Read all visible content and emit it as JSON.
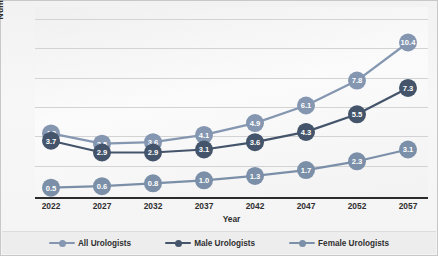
{
  "chart_data": {
    "type": "line",
    "title": "",
    "xlabel": "Year",
    "ylabel": "Number Per 100,000",
    "categories": [
      "2022",
      "2027",
      "2032",
      "2037",
      "2042",
      "2047",
      "2052",
      "2057"
    ],
    "x": [
      2022,
      2027,
      2032,
      2037,
      2042,
      2047,
      2052,
      2057
    ],
    "ylim": [
      0,
      12
    ],
    "xlim": [
      2022,
      2057
    ],
    "grid": "horizontal",
    "legend_position": "bottom",
    "y_tick_labels": [],
    "series": [
      {
        "name": "All Urologists",
        "color": "#8496b0",
        "values": [
          4.2,
          3.5,
          3.6,
          4.1,
          4.9,
          6.1,
          7.8,
          10.4
        ],
        "labels": [
          "4.2",
          "3.5",
          "3.6",
          "4.1",
          "4.9",
          "6.1",
          "7.8",
          "10.4"
        ]
      },
      {
        "name": "Male Urologists",
        "color": "#44546a",
        "values": [
          3.7,
          2.9,
          2.9,
          3.1,
          3.6,
          4.3,
          5.5,
          7.3
        ],
        "labels": [
          "3.7",
          "2.9",
          "2.9",
          "3.1",
          "3.6",
          "4.3",
          "5.5",
          "7.3"
        ]
      },
      {
        "name": "Female Urologists",
        "color": "#7b8fa8",
        "values": [
          0.5,
          0.6,
          0.8,
          1.0,
          1.3,
          1.7,
          2.3,
          3.1
        ],
        "labels": [
          "0.5",
          "0.6",
          "0.8",
          "1.0",
          "1.3",
          "1.7",
          "2.3",
          "3.1"
        ]
      }
    ]
  },
  "axes": {
    "y_title": "Number Per 100,000",
    "x_title": "Year"
  },
  "legend": {
    "items": [
      {
        "label": "All Urologists",
        "color": "#8496b0"
      },
      {
        "label": "Male Urologists",
        "color": "#44546a"
      },
      {
        "label": "Female Urologists",
        "color": "#7b8fa8"
      }
    ]
  },
  "colors": {
    "plot_background": "#f4f4f4",
    "gridline": "#d3d3d3",
    "axis": "#2b2b2b",
    "legend_background": "#ededed",
    "text": "#2f2f2f",
    "label_text": "#ffffff"
  }
}
